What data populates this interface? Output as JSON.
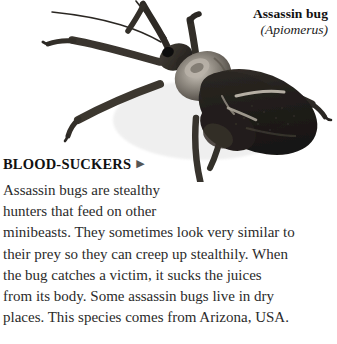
{
  "page": {
    "background_color": "#ffffff",
    "text_color": "#2b2b2b",
    "heading_color": "#111111"
  },
  "photo": {
    "subject": "assassin-bug-specimen-photograph",
    "description": "Dark brown-black assassin bug photographed from above on a white background, body angled diagonally with head at upper left and wing cases at lower right, long thin antennae and six legs spread outward.",
    "body_color": "#2a2622",
    "thorax_highlight_color": "#9c968d",
    "wing_color": "#1d1a18",
    "leg_color": "#33302c"
  },
  "caption": {
    "common_name": "Assassin bug",
    "latin_name": "(Apiomerus)"
  },
  "heading": {
    "label": "BLOOD-SUCKERS",
    "marker": "▶",
    "marker_icon_name": "triangle-right-icon"
  },
  "body": {
    "lines": [
      "Assassin bugs are stealthy",
      "hunters that feed on other",
      "minibeasts. They sometimes look very similar to",
      "their prey so they can creep up stealthily. When",
      "the bug catches a victim, it sucks the juices",
      "from its body. Some assassin bugs live in dry",
      "places. This species comes from Arizona, USA."
    ],
    "full_text": "Assassin bugs are stealthy hunters that feed on other minibeasts. They sometimes look very similar to their prey so they can creep up stealthily. When the bug catches a victim, it sucks the juices from its body. Some assassin bugs live in dry places. This species comes from Arizona, USA."
  }
}
